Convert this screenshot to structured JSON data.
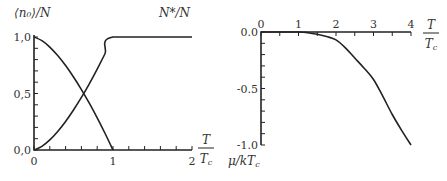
{
  "chart_data": [
    {
      "type": "line",
      "title": "",
      "xlabel": {
        "numerator": "T",
        "denominator": "T_c"
      },
      "ylabel_left": "⟨n₀⟩/N",
      "ylabel_right": "N*/N",
      "xlim": [
        0,
        2
      ],
      "ylim": [
        0,
        1
      ],
      "x_ticks": [
        0,
        1,
        2
      ],
      "x_tick_labels": [
        "0",
        "1",
        "2"
      ],
      "x_minor_step": 0.2,
      "y_ticks": [
        0,
        0.5,
        1
      ],
      "y_tick_labels": [
        "0,0",
        "0,5",
        "1,0"
      ],
      "y_minor_step": 0.1,
      "grid": false,
      "series": [
        {
          "name": "⟨n₀⟩/N",
          "x": [
            0,
            0.1,
            0.2,
            0.3,
            0.4,
            0.5,
            0.6,
            0.7,
            0.8,
            0.9,
            1.0
          ],
          "y": [
            1.0,
            0.968,
            0.911,
            0.836,
            0.747,
            0.646,
            0.535,
            0.414,
            0.284,
            0.146,
            0.0
          ]
        },
        {
          "name": "N*/N",
          "x": [
            0,
            0.1,
            0.2,
            0.3,
            0.4,
            0.5,
            0.6,
            0.7,
            0.8,
            0.9,
            1.0,
            2.0
          ],
          "y": [
            0.0,
            0.032,
            0.089,
            0.164,
            0.253,
            0.354,
            0.465,
            0.586,
            0.716,
            0.854,
            1.0,
            1.0
          ]
        }
      ]
    },
    {
      "type": "line",
      "title": "",
      "xlabel": {
        "numerator": "T",
        "denominator": "T_c"
      },
      "ylabel": "μ/kT_c",
      "xlim": [
        0,
        4
      ],
      "ylim": [
        -1.0,
        0.0
      ],
      "x_ticks": [
        0,
        1,
        2,
        3,
        4
      ],
      "x_tick_labels": [
        "0",
        "1",
        "2",
        "3",
        "4"
      ],
      "x_minor_step": 0.5,
      "y_ticks": [
        0.0,
        -0.5,
        -1.0
      ],
      "y_tick_labels": [
        "0.0",
        "-0.5",
        "-1.0"
      ],
      "y_minor_step": 0.1,
      "grid": false,
      "series": [
        {
          "name": "μ/kT_c",
          "x": [
            0,
            1.0,
            1.25,
            1.5,
            1.75,
            2.0,
            2.25,
            2.5,
            2.75,
            3.0,
            3.25,
            3.5,
            3.75,
            4.0
          ],
          "y": [
            0.0,
            0.0,
            -0.006,
            -0.02,
            -0.04,
            -0.07,
            -0.14,
            -0.23,
            -0.32,
            -0.42,
            -0.57,
            -0.73,
            -0.87,
            -1.0
          ]
        }
      ]
    }
  ]
}
